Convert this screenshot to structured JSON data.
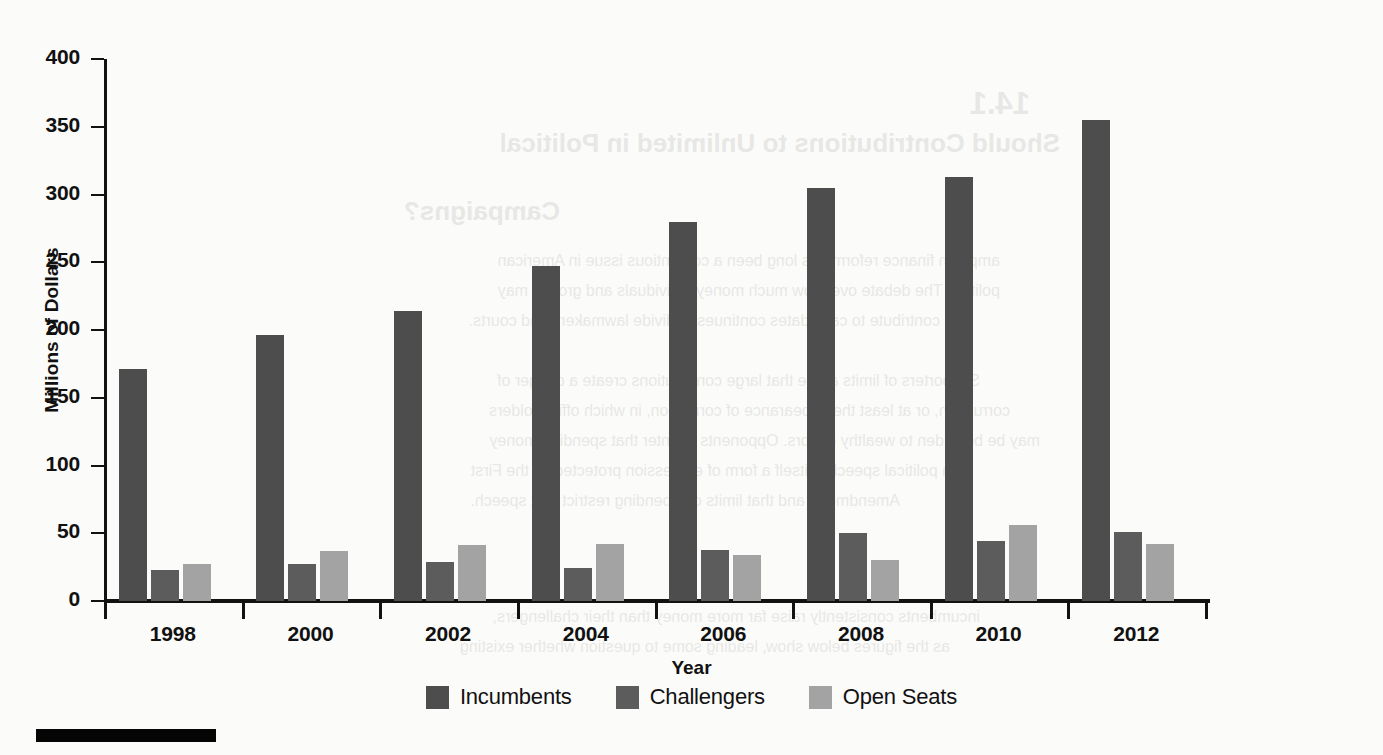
{
  "chart_data": {
    "type": "bar",
    "title": "",
    "xlabel": "Year",
    "ylabel": "Millions of Dollars",
    "categories": [
      "1998",
      "2000",
      "2002",
      "2004",
      "2006",
      "2008",
      "2010",
      "2012"
    ],
    "series": [
      {
        "name": "Incumbents",
        "color": "#4d4d4d",
        "values": [
          171,
          196,
          214,
          247,
          280,
          305,
          313,
          355
        ]
      },
      {
        "name": "Challengers",
        "color": "#5c5c5c",
        "values": [
          23,
          27,
          29,
          24,
          38,
          50,
          44,
          51
        ]
      },
      {
        "name": "Open Seats",
        "color": "#a3a3a3",
        "values": [
          27,
          37,
          41,
          42,
          34,
          30,
          56,
          42
        ]
      }
    ],
    "ylim": [
      0,
      400
    ],
    "yticks": [
      0,
      50,
      100,
      150,
      200,
      250,
      300,
      350,
      400
    ],
    "ytick_labels": [
      "0",
      "50",
      "100",
      "150",
      "200",
      "250",
      "300",
      "350",
      "400"
    ],
    "grid": false,
    "legend_position": "bottom"
  },
  "axes": {
    "y_title": "Millions of Dollars",
    "x_title": "Year"
  },
  "legend": {
    "items": [
      {
        "label": "Incumbents",
        "swatch": "#4d4d4d"
      },
      {
        "label": "Challengers",
        "swatch": "#5c5c5c"
      },
      {
        "label": "Open Seats",
        "swatch": "#a3a3a3"
      }
    ]
  },
  "background_text": {
    "lines": [
      {
        "text": "Should Contributions to Unlimited in Political",
        "style": "h2",
        "x": 352,
        "y": 128
      },
      {
        "text": "Campaigns?",
        "style": "h2",
        "x": 352,
        "y": 196
      },
      {
        "text": "ampaign finance reform has long been a contentious issue in American",
        "style": "p",
        "x": 352,
        "y": 252
      },
      {
        "text": "politics. The debate over how much money individuals and groups may",
        "style": "p",
        "x": 352,
        "y": 282
      },
      {
        "text": "contribute to candidates continues to divide lawmakers and courts.",
        "style": "p",
        "x": 352,
        "y": 312
      },
      {
        "text": "Supporters of limits argue that large contributions create a danger of",
        "style": "p",
        "x": 352,
        "y": 372
      },
      {
        "text": "corruption, or at least the appearance of corruption, in which officeholders",
        "style": "p",
        "x": 352,
        "y": 402
      },
      {
        "text": "may be beholden to wealthy donors. Opponents counter that spending money",
        "style": "p",
        "x": 352,
        "y": 432
      },
      {
        "text": "on political speech is itself a form of expression protected by the First",
        "style": "p",
        "x": 352,
        "y": 462
      },
      {
        "text": "Amendment, and that limits on spending restrict that speech.",
        "style": "p",
        "x": 352,
        "y": 492
      },
      {
        "text": "incumbents consistently raise far more money than their challengers,",
        "style": "p",
        "x": 352,
        "y": 608
      },
      {
        "text": "as the figures below show, leading some to question whether existing",
        "style": "p",
        "x": 352,
        "y": 638
      }
    ]
  }
}
